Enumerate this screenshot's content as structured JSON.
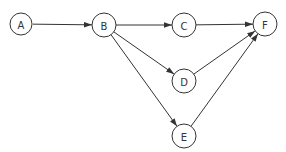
{
  "diagram": {
    "type": "directed-graph",
    "nodes": [
      {
        "id": "A",
        "label": "A",
        "x": 21,
        "y": 24
      },
      {
        "id": "B",
        "label": "B",
        "x": 104,
        "y": 25
      },
      {
        "id": "C",
        "label": "C",
        "x": 184,
        "y": 25
      },
      {
        "id": "F",
        "label": "F",
        "x": 265,
        "y": 24
      },
      {
        "id": "D",
        "label": "D",
        "x": 184,
        "y": 81
      },
      {
        "id": "E",
        "label": "E",
        "x": 184,
        "y": 136
      }
    ],
    "edges": [
      {
        "from": "A",
        "to": "B"
      },
      {
        "from": "B",
        "to": "C"
      },
      {
        "from": "C",
        "to": "F"
      },
      {
        "from": "B",
        "to": "D"
      },
      {
        "from": "B",
        "to": "E"
      },
      {
        "from": "D",
        "to": "F"
      },
      {
        "from": "E",
        "to": "F"
      }
    ],
    "node_radius": 12,
    "colors": {
      "stroke": "#333333",
      "fill": "#ffffff"
    }
  }
}
